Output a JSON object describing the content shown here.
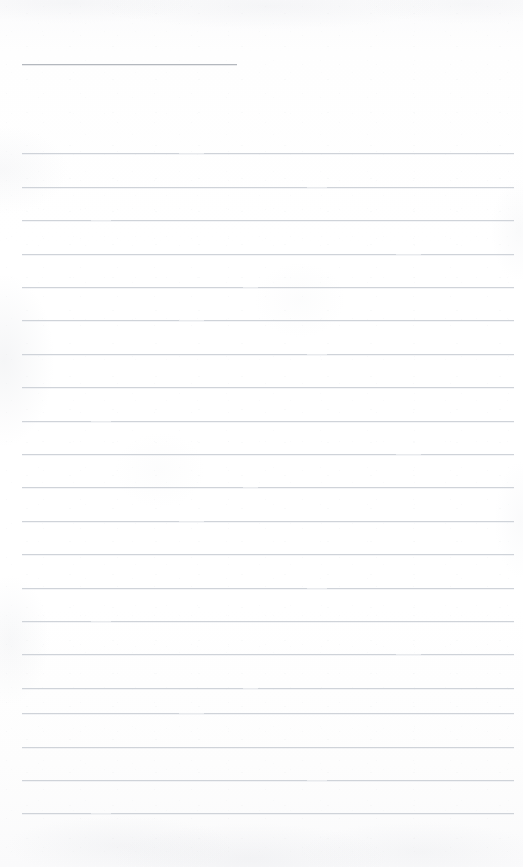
{
  "document": {
    "kind": "lined-notepad-page",
    "title_line_text": "",
    "body_text": "",
    "page_width": 523,
    "page_height": 867
  },
  "colors": {
    "paper": "#fdfdfd",
    "rule": "#cfd3d9",
    "header_rule": "#b4b8be",
    "ink": "#3a3f46"
  },
  "layout": {
    "left_margin": 22,
    "right_edge": 514,
    "line_spacing": 33.5,
    "first_rule_y": 153,
    "header_rule": {
      "y": 64,
      "x_start": 22,
      "x_end": 237
    }
  },
  "rules": [
    {
      "id": "header",
      "y": 64,
      "x": 22,
      "width": 215,
      "kind": "header",
      "break": "no-break"
    },
    {
      "id": "r1",
      "y": 153,
      "x": 22,
      "width": 492,
      "kind": "body",
      "break": "break-a"
    },
    {
      "id": "r2",
      "y": 187,
      "x": 22,
      "width": 492,
      "kind": "body",
      "break": "break-b"
    },
    {
      "id": "r3",
      "y": 220,
      "x": 22,
      "width": 492,
      "kind": "body",
      "break": "break-c"
    },
    {
      "id": "r4",
      "y": 254,
      "x": 22,
      "width": 492,
      "kind": "body",
      "break": "break-d"
    },
    {
      "id": "r5",
      "y": 287,
      "x": 22,
      "width": 492,
      "kind": "body",
      "break": "break-e"
    },
    {
      "id": "r6",
      "y": 320,
      "x": 22,
      "width": 492,
      "kind": "body",
      "break": "break-a"
    },
    {
      "id": "r7",
      "y": 354,
      "x": 22,
      "width": 492,
      "kind": "body",
      "break": "break-b"
    },
    {
      "id": "r8",
      "y": 387,
      "x": 22,
      "width": 492,
      "kind": "body",
      "break": "no-break"
    },
    {
      "id": "r9",
      "y": 421,
      "x": 22,
      "width": 492,
      "kind": "body",
      "break": "break-c"
    },
    {
      "id": "r10",
      "y": 454,
      "x": 22,
      "width": 492,
      "kind": "body",
      "break": "break-d"
    },
    {
      "id": "r11",
      "y": 487,
      "x": 22,
      "width": 492,
      "kind": "body",
      "break": "break-e"
    },
    {
      "id": "r12",
      "y": 521,
      "x": 22,
      "width": 492,
      "kind": "body",
      "break": "break-a"
    },
    {
      "id": "r13",
      "y": 554,
      "x": 22,
      "width": 492,
      "kind": "body",
      "break": "no-break"
    },
    {
      "id": "r14",
      "y": 588,
      "x": 22,
      "width": 492,
      "kind": "body",
      "break": "break-b"
    },
    {
      "id": "r15",
      "y": 621,
      "x": 22,
      "width": 492,
      "kind": "body",
      "break": "break-c"
    },
    {
      "id": "r16",
      "y": 654,
      "x": 22,
      "width": 492,
      "kind": "body",
      "break": "break-d"
    },
    {
      "id": "r17",
      "y": 688,
      "x": 22,
      "width": 492,
      "kind": "body",
      "break": "break-e"
    },
    {
      "id": "r18",
      "y": 713,
      "x": 22,
      "width": 492,
      "kind": "body",
      "break": "break-a"
    },
    {
      "id": "r19",
      "y": 747,
      "x": 22,
      "width": 492,
      "kind": "body",
      "break": "no-break"
    },
    {
      "id": "r20",
      "y": 780,
      "x": 22,
      "width": 492,
      "kind": "body",
      "break": "break-b"
    },
    {
      "id": "r21",
      "y": 813,
      "x": 22,
      "width": 492,
      "kind": "body",
      "break": "break-c"
    }
  ]
}
